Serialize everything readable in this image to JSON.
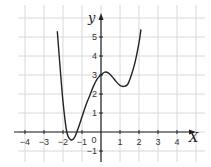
{
  "chart_data": {
    "type": "line",
    "title": "",
    "xlabel": "x",
    "ylabel": "y",
    "xlim": [
      -4.5,
      4.9
    ],
    "ylim": [
      -1.6,
      6.2
    ],
    "grid": true,
    "legend": "none",
    "x_ticks": [
      "-4",
      "-3",
      "-2",
      "-1",
      "0",
      "1",
      "2",
      "3",
      "4"
    ],
    "y_ticks": [
      "-1",
      "1",
      "2",
      "3",
      "4",
      "5"
    ],
    "series": [
      {
        "name": "curve",
        "color": "#222222",
        "x": [
          -2.3,
          -2.2,
          -2.0,
          -1.8,
          -1.6,
          -1.4,
          -1.2,
          -1.0,
          -0.8,
          -0.6,
          -0.4,
          -0.2,
          0.0,
          0.2,
          0.4,
          0.6,
          0.8,
          1.0,
          1.2,
          1.4,
          1.6,
          1.8,
          2.0,
          2.1
        ],
        "y": [
          5.3,
          4.0,
          1.6,
          0.0,
          -0.4,
          -0.3,
          0.2,
          0.8,
          1.4,
          1.9,
          2.4,
          2.8,
          3.0,
          3.15,
          3.1,
          2.9,
          2.65,
          2.45,
          2.4,
          2.5,
          3.0,
          3.7,
          4.7,
          5.4
        ]
      }
    ]
  },
  "labels": {
    "x_axis": "X",
    "y_axis": "y",
    "origin": "0"
  }
}
